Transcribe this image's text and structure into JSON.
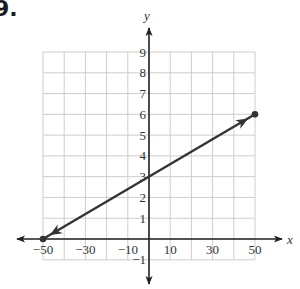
{
  "problem": {
    "label": "9."
  },
  "chart_data": {
    "type": "line",
    "title": "",
    "xlabel": "x",
    "ylabel": "y",
    "xlim": [
      -50,
      50
    ],
    "ylim": [
      -1,
      9
    ],
    "grid": true,
    "x_grid_step": 10,
    "y_grid_step": 1,
    "x_tick_labels": [
      "-50",
      "-30",
      "-10",
      "10",
      "30",
      "50"
    ],
    "x_tick_values": [
      -50,
      -30,
      -10,
      10,
      30,
      50
    ],
    "y_tick_labels": [
      "-1",
      "1",
      "2",
      "3",
      "4",
      "5",
      "6",
      "7",
      "8",
      "9"
    ],
    "y_tick_values": [
      -1,
      1,
      2,
      3,
      4,
      5,
      6,
      7,
      8,
      9
    ],
    "series": [
      {
        "name": "segment",
        "x": [
          -50,
          50
        ],
        "y": [
          0,
          6
        ],
        "endpoints": "closed-dots",
        "arrowheads_near_endpoints": true
      }
    ],
    "y_intercept": 3,
    "slope": 0.06,
    "colors": {
      "line": "#333333",
      "grid": "#c8c8c8",
      "axis": "#222222"
    }
  }
}
